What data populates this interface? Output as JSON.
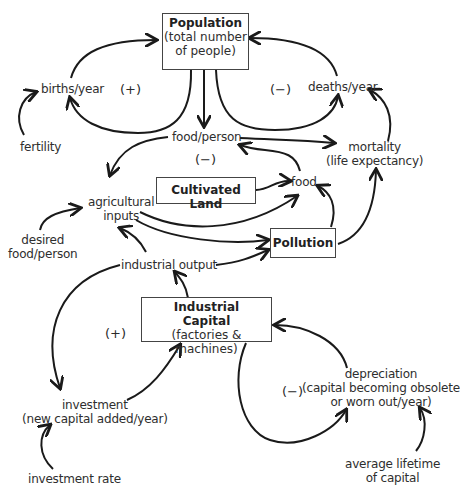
{
  "diagram": {
    "type": "causal-loop-diagram",
    "stocks": {
      "population": {
        "title": "Population",
        "subtitle_line1": "(total number",
        "subtitle_line2": "of people)"
      },
      "cultivated_land": {
        "title": "Cultivated Land"
      },
      "pollution": {
        "title": "Pollution"
      },
      "industrial_capital": {
        "title_line1": "Industrial",
        "title_line2": "Capital",
        "subtitle": "(factories & machines)"
      }
    },
    "variables": {
      "births": "births/year",
      "deaths": "deaths/year",
      "fertility": "fertility",
      "food_per_person": "food/person",
      "mortality_line1": "mortality",
      "mortality_line2": "(life expectancy)",
      "food": "food",
      "agricultural_inputs_line1": "agricultural",
      "agricultural_inputs_line2": "inputs",
      "desired_food_line1": "desired",
      "desired_food_line2": "food/person",
      "industrial_output": "industrial output",
      "investment_line1": "investment",
      "investment_line2": "(new capital added/year)",
      "investment_rate": "investment rate",
      "depreciation_line1": "depreciation",
      "depreciation_line2": "(capital becoming obsolete",
      "depreciation_line3": "or worn out/year)",
      "avg_lifetime_line1": "average lifetime",
      "avg_lifetime_line2": "of capital"
    },
    "loop_signs": {
      "births_loop": "(+)",
      "deaths_loop": "(−)",
      "food_loop": "(−)",
      "investment_loop": "(+)",
      "depreciation_loop": "(−)"
    }
  }
}
